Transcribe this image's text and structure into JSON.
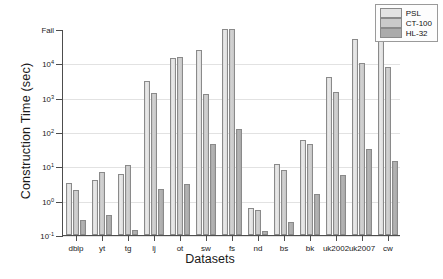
{
  "chart_data": {
    "type": "bar",
    "title": "",
    "xlabel": "Datasets",
    "ylabel": "Construction Time (sec)",
    "yscale": "log",
    "ylim": [
      0.1,
      100000
    ],
    "grid": true,
    "legend_position": "top-right",
    "ytick_labels": [
      "Fail",
      "10⁴",
      "10³",
      "10²",
      "10¹",
      "10⁰",
      "10⁻¹"
    ],
    "ytick_values": [
      100000,
      10000,
      1000,
      100,
      10,
      1,
      0.1
    ],
    "fail_value": 100000,
    "categories": [
      "dblp",
      "yt",
      "tg",
      "lj",
      "ot",
      "sw",
      "fs",
      "nd",
      "bs",
      "bk",
      "uk2002",
      "uk2007",
      "cw"
    ],
    "series": [
      {
        "name": "PSL",
        "color": "#e3e3e3",
        "values": [
          3.2,
          4.1,
          6.0,
          3000,
          14000,
          25000,
          100000,
          0.62,
          11.5,
          58,
          4000,
          50000,
          50000
        ]
      },
      {
        "name": "CT-100",
        "color": "#cacaca",
        "values": [
          2.0,
          7.0,
          11.0,
          1400,
          15000,
          1300,
          100000,
          0.55,
          8.0,
          45,
          1500,
          10000,
          8000
        ]
      },
      {
        "name": "HL-32",
        "color": "#ababab",
        "values": [
          0.28,
          0.38,
          0.14,
          2.2,
          3.0,
          45,
          120,
          0.13,
          0.24,
          1.6,
          5.5,
          32,
          14
        ]
      }
    ]
  },
  "legend": {
    "items": [
      {
        "label": "PSL"
      },
      {
        "label": "CT-100"
      },
      {
        "label": "HL-32"
      }
    ]
  }
}
